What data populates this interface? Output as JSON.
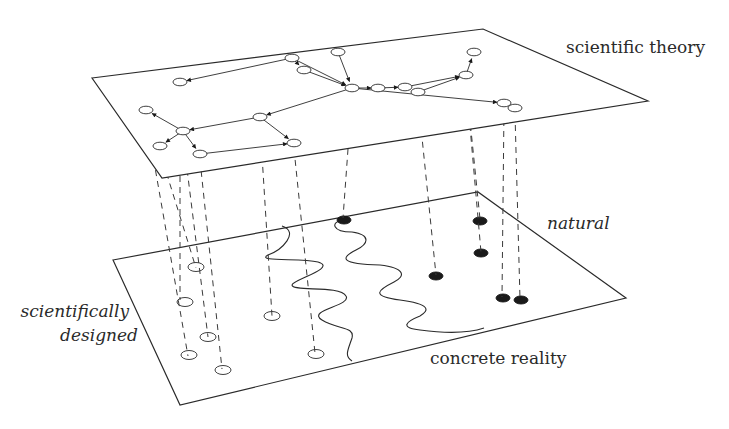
{
  "diagram": {
    "labels": {
      "theory": "scientific theory",
      "natural": "natural",
      "designed_line1": "scientifically",
      "designed_line2": "designed",
      "reality": "concrete reality"
    },
    "colors": {
      "stroke": "#2a2a2a",
      "fill_dark": "#1a1a1a",
      "background": "#ffffff"
    },
    "planes": {
      "theory": {
        "points": [
          [
            92,
            78
          ],
          [
            483,
            29
          ],
          [
            648,
            101
          ],
          [
            162,
            178
          ]
        ]
      },
      "reality": {
        "points": [
          [
            113,
            260
          ],
          [
            478,
            192
          ],
          [
            626,
            298
          ],
          [
            180,
            405
          ]
        ]
      }
    },
    "theory_nodes": [
      {
        "id": "a",
        "x": 180,
        "y": 82
      },
      {
        "id": "b",
        "x": 292,
        "y": 58
      },
      {
        "id": "c",
        "x": 338,
        "y": 52
      },
      {
        "id": "d",
        "x": 474,
        "y": 52
      },
      {
        "id": "e",
        "x": 304,
        "y": 70
      },
      {
        "id": "f",
        "x": 352,
        "y": 88
      },
      {
        "id": "g",
        "x": 378,
        "y": 88
      },
      {
        "id": "h",
        "x": 405,
        "y": 87
      },
      {
        "id": "i",
        "x": 418,
        "y": 92
      },
      {
        "id": "j",
        "x": 466,
        "y": 75
      },
      {
        "id": "k",
        "x": 504,
        "y": 103
      },
      {
        "id": "l",
        "x": 515,
        "y": 108
      },
      {
        "id": "m",
        "x": 146,
        "y": 110
      },
      {
        "id": "n",
        "x": 183,
        "y": 131
      },
      {
        "id": "o",
        "x": 260,
        "y": 117
      },
      {
        "id": "p",
        "x": 160,
        "y": 146
      },
      {
        "id": "q",
        "x": 294,
        "y": 143
      },
      {
        "id": "r",
        "x": 200,
        "y": 154
      }
    ],
    "theory_edges": [
      [
        "b",
        "a"
      ],
      [
        "b",
        "e"
      ],
      [
        "e",
        "f"
      ],
      [
        "b",
        "f"
      ],
      [
        "c",
        "f"
      ],
      [
        "f",
        "g"
      ],
      [
        "g",
        "h"
      ],
      [
        "j",
        "d"
      ],
      [
        "h",
        "j"
      ],
      [
        "i",
        "j"
      ],
      [
        "f",
        "k"
      ],
      [
        "k",
        "l"
      ],
      [
        "f",
        "o"
      ],
      [
        "o",
        "n"
      ],
      [
        "n",
        "m"
      ],
      [
        "n",
        "p"
      ],
      [
        "n",
        "r"
      ],
      [
        "o",
        "q"
      ],
      [
        "r",
        "q"
      ]
    ],
    "projections": [
      {
        "from": [
          180,
          88
        ],
        "to": [
          180,
          300
        ]
      },
      {
        "from": [
          146,
          116
        ],
        "to": [
          188,
          356
        ]
      },
      {
        "from": [
          160,
          152
        ],
        "to": [
          196,
          268
        ]
      },
      {
        "from": [
          183,
          137
        ],
        "to": [
          208,
          337
        ]
      },
      {
        "from": [
          200,
          160
        ],
        "to": [
          222,
          369
        ]
      },
      {
        "from": [
          260,
          123
        ],
        "to": [
          272,
          316
        ]
      },
      {
        "from": [
          294,
          149
        ],
        "to": [
          315,
          353
        ]
      },
      {
        "from": [
          352,
          94
        ],
        "to": [
          343,
          218
        ]
      },
      {
        "from": [
          418,
          98
        ],
        "to": [
          436,
          275
        ]
      },
      {
        "from": [
          466,
          81
        ],
        "to": [
          480,
          219
        ]
      },
      {
        "from": [
          466,
          81
        ],
        "to": [
          481,
          252
        ]
      },
      {
        "from": [
          504,
          109
        ],
        "to": [
          502,
          297
        ]
      },
      {
        "from": [
          515,
          114
        ],
        "to": [
          520,
          299
        ]
      }
    ],
    "reality_open_nodes": [
      {
        "x": 196,
        "y": 267
      },
      {
        "x": 185,
        "y": 302
      },
      {
        "x": 208,
        "y": 337
      },
      {
        "x": 189,
        "y": 355
      },
      {
        "x": 223,
        "y": 370
      },
      {
        "x": 272,
        "y": 316
      },
      {
        "x": 316,
        "y": 354
      }
    ],
    "reality_filled_nodes": [
      {
        "x": 344,
        "y": 220
      },
      {
        "x": 480,
        "y": 221
      },
      {
        "x": 481,
        "y": 253
      },
      {
        "x": 436,
        "y": 276
      },
      {
        "x": 503,
        "y": 298
      },
      {
        "x": 521,
        "y": 300
      }
    ],
    "waves": [
      "M 282 226 C 300 232, 282 250, 268 255 C 255 262, 300 258, 318 262 C 338 268, 292 280, 292 285 C 292 292, 340 285, 346 296 C 352 306, 306 310, 322 320 C 338 330, 355 326, 352 338 C 348 350, 344 356, 352 361",
      "M 343 220 C 330 222, 332 232, 352 232 C 372 235, 368 244, 356 250 C 340 258, 340 264, 380 265 C 405 268, 406 276, 394 282 C 378 290, 370 296, 400 300 C 430 304, 430 310, 420 316 C 405 322, 400 328, 420 330 C 450 334, 472 332, 484 328"
    ]
  }
}
